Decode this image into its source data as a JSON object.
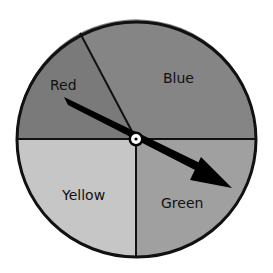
{
  "spinner": {
    "sectors": [
      {
        "name": "red",
        "label": "Red",
        "color": "#7a7a7a"
      },
      {
        "name": "blue",
        "label": "Blue",
        "color": "#858585"
      },
      {
        "name": "green",
        "label": "Green",
        "color": "#a0a0a0"
      },
      {
        "name": "yellow",
        "label": "Yellow",
        "color": "#c6c6c6"
      }
    ],
    "outline_color": "#111111",
    "arrow_color": "#000000",
    "hub_fill": "#ffffff"
  }
}
